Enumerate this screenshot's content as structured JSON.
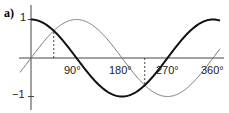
{
  "figure_label": "a)",
  "chart_data": {
    "type": "line",
    "title": "a)",
    "xlabel": "",
    "ylabel": "",
    "x_ticks": [
      "90°",
      "180°",
      "270°",
      "360°"
    ],
    "y_ticks": [
      "1",
      "−1"
    ],
    "xlim": [
      -30,
      380
    ],
    "ylim": [
      -1.1,
      1.1
    ],
    "grid": false,
    "series": [
      {
        "name": "cos x",
        "style": "thick dark",
        "x": [
          0,
          45,
          90,
          135,
          180,
          225,
          270,
          315,
          360
        ],
        "values": [
          1,
          0.71,
          0,
          -0.71,
          -1,
          -0.71,
          0,
          0.71,
          1
        ]
      },
      {
        "name": "sin x",
        "style": "thin grey",
        "x": [
          0,
          45,
          90,
          135,
          180,
          225,
          270,
          315,
          360
        ],
        "values": [
          0,
          0.71,
          1,
          0.71,
          0,
          -0.71,
          -1,
          -0.71,
          0
        ]
      }
    ],
    "annotations": [
      {
        "type": "dashed-vertical",
        "x": 45,
        "from": 0,
        "to": 0.71
      },
      {
        "type": "dashed-vertical",
        "x": 225,
        "from": 0,
        "to": -0.71
      }
    ]
  },
  "labels": {
    "x90": "90°",
    "x180": "180°",
    "x270": "270°",
    "x360": "360°",
    "y1": "1",
    "ym1": "−1"
  }
}
